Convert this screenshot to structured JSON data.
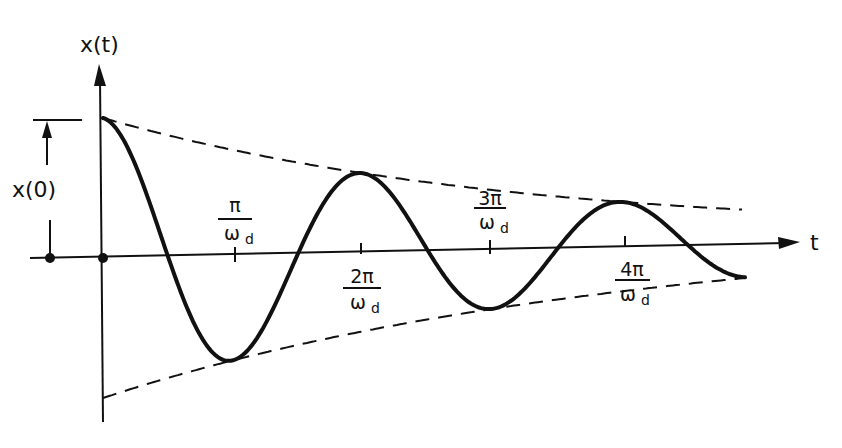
{
  "figure": {
    "y_axis_label": "x(t)",
    "x_axis_label": "t",
    "amplitude_label": "x(0)",
    "ticks": [
      {
        "num": "π",
        "den": "ω",
        "sub": "d",
        "position": "above"
      },
      {
        "num": "2π",
        "den": "ω",
        "sub": "d",
        "position": "below"
      },
      {
        "num": "3π",
        "den": "ω",
        "sub": "d",
        "position": "above"
      },
      {
        "num": "4π",
        "den": "ω",
        "sub": "d",
        "position": "below"
      }
    ],
    "colors": {
      "line": "#111111",
      "background": "#ffffff"
    }
  },
  "chart_data": {
    "type": "line",
    "title": "",
    "xlabel": "t",
    "ylabel": "x(t)",
    "x_ticks": [
      "π/ω_d",
      "2π/ω_d",
      "3π/ω_d",
      "4π/ω_d"
    ],
    "series": [
      {
        "name": "x(t) damped oscillation",
        "style": "solid",
        "description": "x(0)·e^(-ζωn t)·cos(ωd t), starts at x(0), decays"
      },
      {
        "name": "upper envelope",
        "style": "dashed",
        "description": "+x(0)·e^(-ζωn t)"
      },
      {
        "name": "lower envelope",
        "style": "dashed",
        "description": "-x(0)·e^(-ζωn t)"
      }
    ],
    "grid": false
  }
}
